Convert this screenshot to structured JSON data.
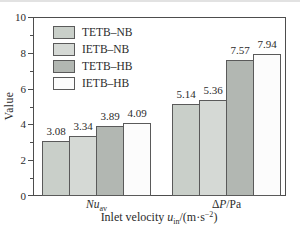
{
  "chart_data": {
    "type": "bar",
    "title": "",
    "ylabel": "Value",
    "xlabel": "Inlet velocity u_in/(m·s−2)",
    "xlabel_segments": [
      {
        "t": "Inlet velocity ",
        "s": "plain"
      },
      {
        "t": "u",
        "s": "italic"
      },
      {
        "t": "in",
        "s": "sub"
      },
      {
        "t": "/(m·s",
        "s": "plain"
      },
      {
        "t": "−2",
        "s": "sup"
      },
      {
        "t": ")",
        "s": "plain"
      }
    ],
    "ylim": [
      0,
      10
    ],
    "y_major_ticks": [
      0,
      2,
      4,
      6,
      8,
      10
    ],
    "y_minor_ticks": [
      1,
      3,
      5,
      7,
      9
    ],
    "grid": false,
    "legend_position": "top-left",
    "categories": [
      "Nu_av",
      "ΔP/Pa"
    ],
    "category_segments": [
      [
        {
          "t": "Nu",
          "s": "italic"
        },
        {
          "t": "av",
          "s": "sub"
        }
      ],
      [
        {
          "t": "Δ",
          "s": "plain"
        },
        {
          "t": "P",
          "s": "italic"
        },
        {
          "t": "/Pa",
          "s": "plain"
        }
      ]
    ],
    "series": [
      {
        "name": "TETB–NB",
        "color": "#c9cfc9",
        "values": [
          3.08,
          5.14
        ],
        "labels": [
          "3.08",
          "5.14"
        ]
      },
      {
        "name": "IETB–NB",
        "color": "#d5d9d5",
        "values": [
          3.34,
          5.36
        ],
        "labels": [
          "3.34",
          "5.36"
        ]
      },
      {
        "name": "TETB–HB",
        "color": "#b2b7b2",
        "values": [
          3.89,
          7.57
        ],
        "labels": [
          "3.89",
          "7.57"
        ]
      },
      {
        "name": "IETB–HB",
        "color": "#fcfcfc",
        "values": [
          4.09,
          7.94
        ],
        "labels": [
          "4.09",
          "7.94"
        ]
      }
    ],
    "colors": {
      "axis": "#4d4d4d",
      "text": "#2b2b2b",
      "bar_border": "#5a5a5a",
      "background": "#ffffff"
    }
  }
}
